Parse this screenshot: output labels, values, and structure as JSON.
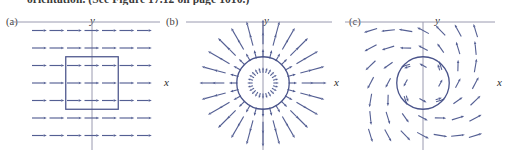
{
  "caption": {
    "clipped_line": "orientation. (See Figure 17.12 on page 1010.)"
  },
  "panels": [
    {
      "id": "a",
      "label": "(a)",
      "x_axis_label": "x",
      "y_axis_label": "y",
      "field_type": "uniform-horizontal",
      "shape": "square",
      "accent": "#4a5386"
    },
    {
      "id": "b",
      "label": "(b)",
      "x_axis_label": "x",
      "y_axis_label": "y",
      "field_type": "radial-outward",
      "shape": "circle",
      "accent": "#4a5386"
    },
    {
      "id": "c",
      "label": "(c)",
      "x_axis_label": "x",
      "y_axis_label": "y",
      "field_type": "rotational-swirl",
      "shape": "circle",
      "accent": "#4a5386"
    }
  ],
  "colors": {
    "arrow": "#545f93",
    "axis": "#9a9ab0",
    "curve": "#49538a",
    "background": "#ffffff"
  },
  "chart_data": {
    "type": "scatter",
    "title": "",
    "xlabel": "x",
    "ylabel": "y",
    "grid": false,
    "legend": "none",
    "panels": [
      {
        "id": "a",
        "label": "(a)",
        "description": "Uniform vector field F = i; all arrows point in +x direction with equal length. A square boundary curve is drawn around the origin.",
        "xlim": [
          -3.5,
          3.5
        ],
        "ylim": [
          -3.5,
          3.5
        ],
        "boundary": {
          "kind": "square",
          "cx": 0,
          "cy": 0,
          "half_width": 1.5
        },
        "vectors": [
          {
            "x": -3,
            "y": 3,
            "u": 1,
            "v": 0
          },
          {
            "x": -2,
            "y": 3,
            "u": 1,
            "v": 0
          },
          {
            "x": -1,
            "y": 3,
            "u": 1,
            "v": 0
          },
          {
            "x": 0,
            "y": 3,
            "u": 1,
            "v": 0
          },
          {
            "x": 1,
            "y": 3,
            "u": 1,
            "v": 0
          },
          {
            "x": 2,
            "y": 3,
            "u": 1,
            "v": 0
          },
          {
            "x": 3,
            "y": 3,
            "u": 1,
            "v": 0
          },
          {
            "x": -3,
            "y": 2,
            "u": 1,
            "v": 0
          },
          {
            "x": -2,
            "y": 2,
            "u": 1,
            "v": 0
          },
          {
            "x": -1,
            "y": 2,
            "u": 1,
            "v": 0
          },
          {
            "x": 0,
            "y": 2,
            "u": 1,
            "v": 0
          },
          {
            "x": 1,
            "y": 2,
            "u": 1,
            "v": 0
          },
          {
            "x": 2,
            "y": 2,
            "u": 1,
            "v": 0
          },
          {
            "x": 3,
            "y": 2,
            "u": 1,
            "v": 0
          },
          {
            "x": -3,
            "y": 1,
            "u": 1,
            "v": 0
          },
          {
            "x": -2,
            "y": 1,
            "u": 1,
            "v": 0
          },
          {
            "x": -1,
            "y": 1,
            "u": 1,
            "v": 0
          },
          {
            "x": 0,
            "y": 1,
            "u": 1,
            "v": 0
          },
          {
            "x": 1,
            "y": 1,
            "u": 1,
            "v": 0
          },
          {
            "x": 2,
            "y": 1,
            "u": 1,
            "v": 0
          },
          {
            "x": 3,
            "y": 1,
            "u": 1,
            "v": 0
          },
          {
            "x": -3,
            "y": 0,
            "u": 1,
            "v": 0
          },
          {
            "x": -2,
            "y": 0,
            "u": 1,
            "v": 0
          },
          {
            "x": -1,
            "y": 0,
            "u": 1,
            "v": 0
          },
          {
            "x": 0,
            "y": 0,
            "u": 1,
            "v": 0
          },
          {
            "x": 1,
            "y": 0,
            "u": 1,
            "v": 0
          },
          {
            "x": 2,
            "y": 0,
            "u": 1,
            "v": 0
          },
          {
            "x": 3,
            "y": 0,
            "u": 1,
            "v": 0
          },
          {
            "x": -3,
            "y": -1,
            "u": 1,
            "v": 0
          },
          {
            "x": -2,
            "y": -1,
            "u": 1,
            "v": 0
          },
          {
            "x": -1,
            "y": -1,
            "u": 1,
            "v": 0
          },
          {
            "x": 0,
            "y": -1,
            "u": 1,
            "v": 0
          },
          {
            "x": 1,
            "y": -1,
            "u": 1,
            "v": 0
          },
          {
            "x": 2,
            "y": -1,
            "u": 1,
            "v": 0
          },
          {
            "x": 3,
            "y": -1,
            "u": 1,
            "v": 0
          },
          {
            "x": -3,
            "y": -2,
            "u": 1,
            "v": 0
          },
          {
            "x": -2,
            "y": -2,
            "u": 1,
            "v": 0
          },
          {
            "x": -1,
            "y": -2,
            "u": 1,
            "v": 0
          },
          {
            "x": 0,
            "y": -2,
            "u": 1,
            "v": 0
          },
          {
            "x": 1,
            "y": -2,
            "u": 1,
            "v": 0
          },
          {
            "x": 2,
            "y": -2,
            "u": 1,
            "v": 0
          },
          {
            "x": 3,
            "y": -2,
            "u": 1,
            "v": 0
          },
          {
            "x": -3,
            "y": -3,
            "u": 1,
            "v": 0
          },
          {
            "x": -2,
            "y": -3,
            "u": 1,
            "v": 0
          },
          {
            "x": -1,
            "y": -3,
            "u": 1,
            "v": 0
          },
          {
            "x": 0,
            "y": -3,
            "u": 1,
            "v": 0
          },
          {
            "x": 1,
            "y": -3,
            "u": 1,
            "v": 0
          },
          {
            "x": 2,
            "y": -3,
            "u": 1,
            "v": 0
          },
          {
            "x": 3,
            "y": -3,
            "u": 1,
            "v": 0
          }
        ]
      },
      {
        "id": "b",
        "label": "(b)",
        "description": "Radial source field F = (x, y)/|r|; arrows point outward away from the origin along rays, length grows with distance. A circle of radius 1.5 is drawn about the origin.",
        "xlim": [
          -3.5,
          3.5
        ],
        "ylim": [
          -3.5,
          3.5
        ],
        "boundary": {
          "kind": "circle",
          "cx": 0,
          "cy": 0,
          "radius": 1.5
        },
        "rays": 24,
        "radii": [
          0.75,
          1.7,
          2.55,
          3.2
        ]
      },
      {
        "id": "c",
        "label": "(c)",
        "description": "Rotational / swirling vector field; arrows curl counterclockwise around the origin with a radial outward component, producing a spiral pattern. A circle of radius 1.5 is drawn about the origin.",
        "xlim": [
          -3.5,
          3.5
        ],
        "ylim": [
          -3.5,
          3.5
        ],
        "boundary": {
          "kind": "circle",
          "cx": 0,
          "cy": 0,
          "radius": 1.5
        },
        "grid_step": 1,
        "swirl_angle_deg": 62
      }
    ]
  }
}
